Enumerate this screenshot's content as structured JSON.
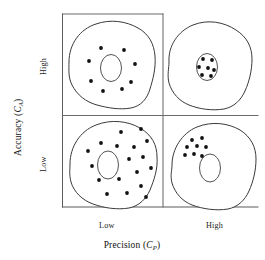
{
  "figure": {
    "background_color": "#ffffff",
    "line_color": "#3a3a3a",
    "dot_color": "#111111",
    "axis_color": "#5b5b5b"
  },
  "axes": {
    "y": {
      "label_text": "Accuracy",
      "label_symbol": "C",
      "label_subscript": "A",
      "ticks": [
        {
          "label": "High",
          "position": "upper"
        },
        {
          "label": "Low",
          "position": "lower"
        }
      ]
    },
    "x": {
      "label_text": "Precision",
      "label_symbol": "C",
      "label_subscript": "P",
      "ticks": [
        {
          "label": "Low",
          "position": "left"
        },
        {
          "label": "High",
          "position": "right"
        }
      ]
    }
  },
  "chart_data": {
    "type": "scatter",
    "xlabel": "Precision (C_P)",
    "ylabel": "Accuracy (C_A)",
    "xlim": [
      0,
      2
    ],
    "ylim": [
      0,
      2
    ],
    "grid": false,
    "legend": "none",
    "x_tick_labels": [
      "Low",
      "High"
    ],
    "y_tick_labels": [
      "Low",
      "High"
    ],
    "quadrants": [
      {
        "name": "high-accuracy-low-precision",
        "accuracy": "High",
        "precision": "Low",
        "row": "top",
        "column": "left",
        "dot_count": 8,
        "dot_pattern": "ring around centered target",
        "target": {
          "cx": 111,
          "cy": 68,
          "rx": 10.5,
          "ry": 13.5
        },
        "blob_path": "M 69,62 C 69,44 80,29 96,24 C 110,19 126,21 138,28 C 149,34 154,44 155,56 C 156,68 153,79 150,89 C 147,99 141,106 131,108 C 120,110 108,108 97,105 C 86,102 77,95 72,85 C 68,77 69,69 69,62 Z",
        "dots": [
          {
            "x": 101,
            "y": 48
          },
          {
            "x": 124,
            "y": 50
          },
          {
            "x": 89,
            "y": 61
          },
          {
            "x": 135,
            "y": 64
          },
          {
            "x": 91,
            "y": 81
          },
          {
            "x": 131,
            "y": 82
          },
          {
            "x": 103,
            "y": 91
          },
          {
            "x": 122,
            "y": 89
          }
        ]
      },
      {
        "name": "high-accuracy-high-precision",
        "accuracy": "High",
        "precision": "High",
        "row": "top",
        "column": "right",
        "dot_count": 7,
        "dot_pattern": "tight cluster centered inside target",
        "target": {
          "cx": 207,
          "cy": 67,
          "rx": 10.5,
          "ry": 13.5
        },
        "blob_path": "M 169,62 C 168,46 178,31 193,25 C 208,19 224,22 236,30 C 247,37 252,47 252,59 C 252,71 249,82 245,91 C 241,100 234,107 224,109 C 212,111 199,109 189,105 C 179,101 172,93 169,83 C 167,75 169,68 169,62 Z",
        "dots": [
          {
            "x": 203,
            "y": 59
          },
          {
            "x": 212,
            "y": 60
          },
          {
            "x": 199,
            "y": 67
          },
          {
            "x": 208,
            "y": 68
          },
          {
            "x": 214,
            "y": 70
          },
          {
            "x": 202,
            "y": 75
          },
          {
            "x": 211,
            "y": 76
          }
        ]
      },
      {
        "name": "low-accuracy-low-precision",
        "accuracy": "Low",
        "precision": "Low",
        "row": "bottom",
        "column": "left",
        "dot_count": 18,
        "dot_pattern": "wide scatter across blob, target off-center",
        "target": {
          "cx": 108,
          "cy": 165,
          "rx": 10.5,
          "ry": 14
        },
        "blob_path": "M 70,164 C 70,147 80,131 96,125 C 111,119 128,121 140,128 C 152,135 157,145 157,157 C 158,169 154,180 150,190 C 146,199 139,206 129,208 C 117,210 104,208 93,204 C 82,200 74,192 71,182 C 69,174 70,170 70,164 Z",
        "dots": [
          {
            "x": 121,
            "y": 132
          },
          {
            "x": 141,
            "y": 129
          },
          {
            "x": 101,
            "y": 143
          },
          {
            "x": 117,
            "y": 146
          },
          {
            "x": 134,
            "y": 147
          },
          {
            "x": 88,
            "y": 151
          },
          {
            "x": 147,
            "y": 141
          },
          {
            "x": 129,
            "y": 159
          },
          {
            "x": 92,
            "y": 166
          },
          {
            "x": 143,
            "y": 157
          },
          {
            "x": 137,
            "y": 172
          },
          {
            "x": 151,
            "y": 168
          },
          {
            "x": 99,
            "y": 180
          },
          {
            "x": 119,
            "y": 179
          },
          {
            "x": 141,
            "y": 186
          },
          {
            "x": 107,
            "y": 194
          },
          {
            "x": 127,
            "y": 193
          },
          {
            "x": 146,
            "y": 197
          }
        ]
      },
      {
        "name": "low-accuracy-high-precision",
        "accuracy": "Low",
        "precision": "High",
        "row": "bottom",
        "column": "right",
        "dot_count": 8,
        "dot_pattern": "tight cluster offset up-left from target",
        "target": {
          "cx": 210,
          "cy": 168,
          "rx": 10.5,
          "ry": 14
        },
        "blob_path": "M 172,165 C 172,149 182,133 197,127 C 212,121 228,123 240,130 C 251,137 256,147 256,159 C 256,171 253,182 249,191 C 245,200 238,207 228,209 C 216,211 203,209 192,205 C 182,201 175,193 172,183 C 170,175 172,171 172,165 Z",
        "dots": [
          {
            "x": 192,
            "y": 140
          },
          {
            "x": 202,
            "y": 138
          },
          {
            "x": 187,
            "y": 147
          },
          {
            "x": 197,
            "y": 146
          },
          {
            "x": 206,
            "y": 147
          },
          {
            "x": 185,
            "y": 155
          },
          {
            "x": 194,
            "y": 154
          },
          {
            "x": 202,
            "y": 156
          }
        ]
      }
    ]
  }
}
